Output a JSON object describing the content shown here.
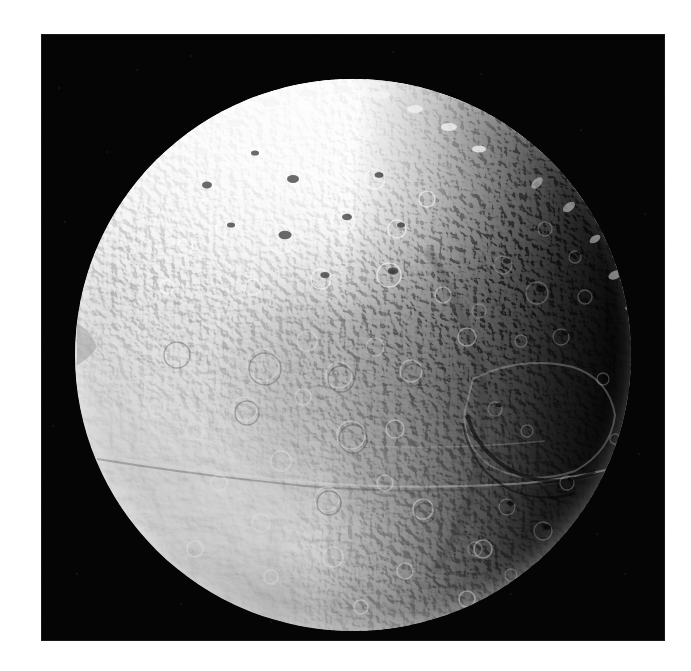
{
  "image": {
    "subject": "Iapetus",
    "alt_text": "Grayscale spacecraft photograph of Saturn's moon Iapetus",
    "caption": "",
    "kind": "natural-image",
    "background_color": "#ffffff",
    "sky_color": "#050505",
    "frame": {
      "x": 41,
      "y": 34,
      "width": 624,
      "height": 607
    }
  },
  "body": {
    "name": "Iapetus",
    "disk": {
      "center_x": 353,
      "center_y": 355,
      "radius_x": 278,
      "radius_y": 276
    },
    "surface_tone_hex": "#8d8d8d",
    "bright_cap_hex": "#f2f2f2",
    "dark_terrain_hex": "#3b3b3b",
    "shadow_hex": "#0a0a0a"
  },
  "features": [
    {
      "id": "north-polar-bright-terrain",
      "label": "Bright cratered north polar terrain",
      "tone": "bright"
    },
    {
      "id": "cassini-regio-dark-terrain",
      "label": "Dark leading-hemisphere terrain",
      "tone": "dark"
    },
    {
      "id": "equatorial-ridge",
      "label": "Equatorial ridge",
      "tone": "mid"
    },
    {
      "id": "terminator",
      "label": "Day/night terminator along the eastern limb",
      "tone": "shadow"
    },
    {
      "id": "large-impact-basin",
      "label": "Large impact basin with shadowed rim",
      "tone": "mid"
    },
    {
      "id": "limb-notch",
      "label": "Limb irregularity on the western edge",
      "tone": "mid"
    }
  ],
  "lighting": {
    "sun_direction": "upper-left",
    "terminator_side": "right",
    "phase": "gibbous"
  }
}
